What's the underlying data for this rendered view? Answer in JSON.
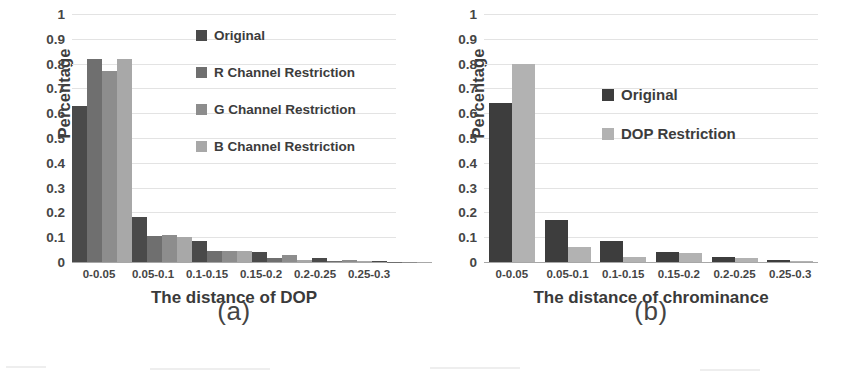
{
  "figure": {
    "background": "#ffffff",
    "panels": [
      {
        "caption": "(a)",
        "xlabel": "The distance of DOP",
        "ylabel": "Percentage",
        "legend_title": "",
        "chart_data": {
          "type": "bar",
          "title": "",
          "subtitle": "",
          "xlabel": "The distance of DOP",
          "ylabel": "Percentage",
          "categories": [
            "0-0.05",
            "0.05-0.1",
            "0.1-0.15",
            "0.15-0.2",
            "0.2-0.25",
            "0.25-0.3"
          ],
          "series": [
            {
              "name": "Original",
              "color": "#4a4a4a",
              "values": [
                0.63,
                0.18,
                0.085,
                0.04,
                0.015,
                0.006
              ]
            },
            {
              "name": "R Channel Restriction",
              "color": "#6f6f6f",
              "values": [
                0.82,
                0.105,
                0.045,
                0.015,
                0.005,
                0.002
              ]
            },
            {
              "name": "G Channel Restriction",
              "color": "#8d8d8d",
              "values": [
                0.77,
                0.11,
                0.045,
                0.03,
                0.01,
                0.002
              ]
            },
            {
              "name": "B Channel Restriction",
              "color": "#a8a8a8",
              "values": [
                0.82,
                0.1,
                0.045,
                0.01,
                0.003,
                0.001
              ]
            }
          ],
          "ylim": [
            0,
            1
          ],
          "yticks": [
            1,
            0.9,
            0.8,
            0.7,
            0.6,
            0.5,
            0.4,
            0.3,
            0.2,
            0.1,
            0
          ],
          "ytick_labels": [
            "1",
            "0.9",
            "0.8",
            "0.7",
            "0.6",
            "0.5",
            "0.4",
            "0.3",
            "0.2",
            "0.1",
            "0"
          ],
          "grid": true,
          "legend_position": "inside-top-right"
        }
      },
      {
        "caption": "(b)",
        "xlabel": "The distance of chrominance",
        "ylabel": "Percentage",
        "legend_title": "",
        "chart_data": {
          "type": "bar",
          "title": "",
          "subtitle": "",
          "xlabel": "The distance of chrominance",
          "ylabel": "Percentage",
          "categories": [
            "0-0.05",
            "0.05-0.1",
            "0.1-0.15",
            "0.15-0.2",
            "0.2-0.25",
            "0.25-0.3"
          ],
          "series": [
            {
              "name": "Original",
              "color": "#3d3d3d",
              "values": [
                0.64,
                0.17,
                0.085,
                0.04,
                0.02,
                0.01
              ]
            },
            {
              "name": "DOP Restriction",
              "color": "#b2b2b2",
              "values": [
                0.8,
                0.06,
                0.02,
                0.035,
                0.015,
                0.005
              ]
            }
          ],
          "ylim": [
            0,
            1
          ],
          "yticks": [
            1,
            0.9,
            0.8,
            0.7,
            0.6,
            0.5,
            0.4,
            0.3,
            0.2,
            0.1,
            0
          ],
          "ytick_labels": [
            "1",
            "0.9",
            "0.8",
            "0.7",
            "0.6",
            "0.5",
            "0.4",
            "0.3",
            "0.2",
            "0.1",
            "0"
          ],
          "grid": true,
          "legend_position": "inside-top-right"
        }
      }
    ]
  },
  "chart_data": [
    {
      "type": "bar",
      "title": "",
      "xlabel": "The distance of DOP",
      "ylabel": "Percentage",
      "categories": [
        "0-0.05",
        "0.05-0.1",
        "0.1-0.15",
        "0.15-0.2",
        "0.2-0.25",
        "0.25-0.3"
      ],
      "series": [
        {
          "name": "Original",
          "values": [
            0.63,
            0.18,
            0.085,
            0.04,
            0.015,
            0.006
          ]
        },
        {
          "name": "R Channel Restriction",
          "values": [
            0.82,
            0.105,
            0.045,
            0.015,
            0.005,
            0.002
          ]
        },
        {
          "name": "G Channel Restriction",
          "values": [
            0.77,
            0.11,
            0.045,
            0.03,
            0.01,
            0.002
          ]
        },
        {
          "name": "B Channel Restriction",
          "values": [
            0.82,
            0.1,
            0.045,
            0.01,
            0.003,
            0.001
          ]
        }
      ],
      "ylim": [
        0,
        1
      ],
      "ytick_labels": [
        "1",
        "0.9",
        "0.8",
        "0.7",
        "0.6",
        "0.5",
        "0.4",
        "0.3",
        "0.2",
        "0.1",
        "0"
      ],
      "grid": true,
      "legend_position": "inside-top-right",
      "caption": "(a)"
    },
    {
      "type": "bar",
      "title": "",
      "xlabel": "The distance of chrominance",
      "ylabel": "Percentage",
      "categories": [
        "0-0.05",
        "0.05-0.1",
        "0.1-0.15",
        "0.15-0.2",
        "0.2-0.25",
        "0.25-0.3"
      ],
      "series": [
        {
          "name": "Original",
          "values": [
            0.64,
            0.17,
            0.085,
            0.04,
            0.02,
            0.01
          ]
        },
        {
          "name": "DOP Restriction",
          "values": [
            0.8,
            0.06,
            0.02,
            0.035,
            0.015,
            0.005
          ]
        }
      ],
      "ylim": [
        0,
        1
      ],
      "ytick_labels": [
        "1",
        "0.9",
        "0.8",
        "0.7",
        "0.6",
        "0.5",
        "0.4",
        "0.3",
        "0.2",
        "0.1",
        "0"
      ],
      "grid": true,
      "legend_position": "inside-top-right",
      "caption": "(b)"
    }
  ]
}
